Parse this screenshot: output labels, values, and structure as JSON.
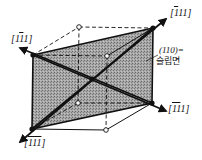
{
  "diagram": {
    "type": "crystal-unit-cell-slip-plane",
    "plane_label": "(110)=",
    "plane_caption": "슬립면",
    "directions": [
      {
        "id": "top-right",
        "text": "[1̄11]",
        "parts": [
          "[",
          "1",
          "11]"
        ],
        "overbar_index": 1
      },
      {
        "id": "left",
        "text": "[11̄1]",
        "parts": [
          "[1",
          "1",
          "1]"
        ],
        "overbar_index": 1
      },
      {
        "id": "right",
        "text": "[1̄1̄1]",
        "parts": [
          "[",
          "11",
          "1]"
        ],
        "overbar_index": 1
      },
      {
        "id": "bottom-left",
        "text": "[1̄1̄1̄]",
        "parts": [
          "[",
          "111",
          "]"
        ],
        "overbar_index": 1
      }
    ],
    "colors": {
      "plane_fill": "#9a9a9a",
      "line": "#111111",
      "background": "#ffffff"
    }
  }
}
